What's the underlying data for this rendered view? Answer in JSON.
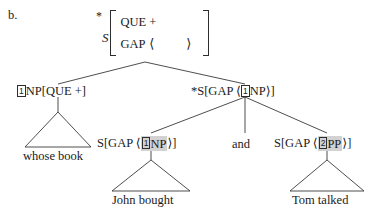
{
  "figure": {
    "item_label": "b.",
    "type": "syntax-tree",
    "notation": "HPSG / GPSG feature-structure tree"
  },
  "root": {
    "star": "*",
    "category": "S",
    "features": [
      {
        "attribute": "QUE",
        "value": "+"
      },
      {
        "attribute": "GAP",
        "value": "",
        "brackets": [
          "⟨",
          "⟩"
        ]
      }
    ]
  },
  "nodes": {
    "left_daughter": {
      "index": "1",
      "text_before_index": "",
      "text_after_index": "NP[QUE +]"
    },
    "right_daughter": {
      "prefix": "*S[GAP ",
      "open_angle": "⟨",
      "index": "1",
      "tag": "NP",
      "close_angle": "⟩",
      "suffix": "]"
    },
    "conjunct_left": {
      "prefix": "S[GAP ",
      "open_angle": "⟨",
      "index": "1",
      "tag": "NP",
      "close_angle": "⟩",
      "suffix": "]",
      "highlighted": true
    },
    "conjunction": "and",
    "conjunct_right": {
      "prefix": "S[GAP ",
      "open_angle": "⟨",
      "index": "2",
      "tag": "PP",
      "close_angle": "⟩",
      "suffix": "]",
      "highlighted": true
    }
  },
  "leaves": [
    {
      "text": "whose book"
    },
    {
      "text": "John bought"
    },
    {
      "text": "Tom talked"
    }
  ],
  "colors": {
    "ink": "#1a1a1a",
    "line": "#3a3a3a",
    "highlight": "#d2d2d2",
    "background": "#ffffff"
  }
}
